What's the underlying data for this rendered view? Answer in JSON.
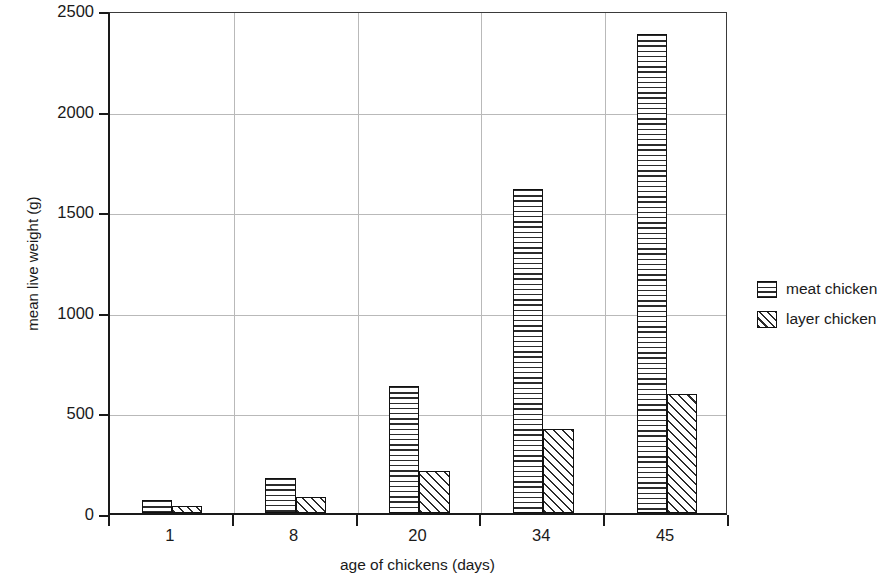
{
  "chart_data": {
    "type": "bar",
    "title": "",
    "subtitle": "",
    "xlabel": "age of chickens (days)",
    "ylabel": "mean live weight (g)",
    "categories": [
      "1",
      "8",
      "20",
      "34",
      "45"
    ],
    "series": [
      {
        "name": "meat chicken",
        "values": [
          65,
          175,
          630,
          1610,
          2380
        ]
      },
      {
        "name": "layer chicken",
        "values": [
          35,
          80,
          210,
          420,
          590
        ]
      }
    ],
    "ylim": [
      0,
      2500
    ],
    "yticks": [
      0,
      500,
      1000,
      1500,
      2000,
      2500
    ],
    "ytick_labels": [
      "0",
      "500",
      "1000",
      "1500",
      "2000",
      "2500"
    ],
    "grid": "horizontal-and-vertical",
    "grid_color": "#b9b9b9",
    "legend_position": "right-outside",
    "axis_color": "#1a1a1a",
    "bar_outline_color": "#111111",
    "bar_fill_color": "#ffffff",
    "hatch_color": "#2b2b2b",
    "series_patterns": [
      "horizontal-lines",
      "diagonal-hatch"
    ],
    "annotations": []
  },
  "legend": {
    "entries": [
      {
        "label": "meat chicken",
        "pattern": "horizontal-lines"
      },
      {
        "label": "layer chicken",
        "pattern": "diagonal-hatch"
      }
    ]
  }
}
